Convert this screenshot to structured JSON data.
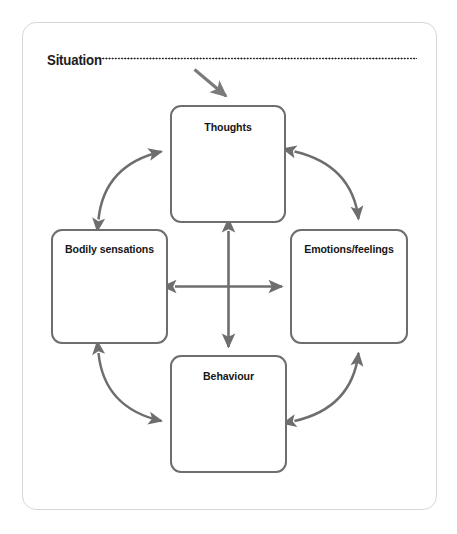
{
  "worksheet": {
    "title": "Situation",
    "frame_color": "#d6d6d6",
    "box_border_color": "#6e6e6e",
    "arrow_color": "#6e6e6e",
    "text_color": "#161616",
    "background": "#ffffff"
  },
  "situation": {
    "label": "Situation",
    "dotted_fill_line": true
  },
  "nodes": [
    {
      "id": "thoughts",
      "label": "Thoughts",
      "position": "top"
    },
    {
      "id": "bodily",
      "label": "Bodily sensations",
      "position": "left"
    },
    {
      "id": "emotions",
      "label": "Emotions/feelings",
      "position": "right"
    },
    {
      "id": "behaviour",
      "label": "Behaviour",
      "position": "bottom"
    }
  ],
  "connectors": {
    "situation_to_thoughts": {
      "name": "situation-arrow",
      "style": "straight",
      "heads": "single",
      "from": "Situation",
      "to": "Thoughts"
    },
    "curves": [
      {
        "name": "thoughts-bodily-curve",
        "from": "Thoughts",
        "to": "Bodily sensations",
        "heads": "double",
        "style": "curved"
      },
      {
        "name": "thoughts-emotions-curve",
        "from": "Thoughts",
        "to": "Emotions/feelings",
        "heads": "double",
        "style": "curved"
      },
      {
        "name": "bodily-behaviour-curve",
        "from": "Bodily sensations",
        "to": "Behaviour",
        "heads": "double",
        "style": "curved"
      },
      {
        "name": "emotions-behaviour-curve",
        "from": "Emotions/feelings",
        "to": "Behaviour",
        "heads": "double",
        "style": "curved"
      }
    ],
    "cross": [
      {
        "name": "vertical-cross-arrow",
        "from": "Thoughts",
        "to": "Behaviour",
        "heads": "double",
        "style": "straight"
      },
      {
        "name": "horizontal-cross-arrow",
        "from": "Bodily sensations",
        "to": "Emotions/feelings",
        "heads": "double",
        "style": "straight"
      }
    ]
  }
}
